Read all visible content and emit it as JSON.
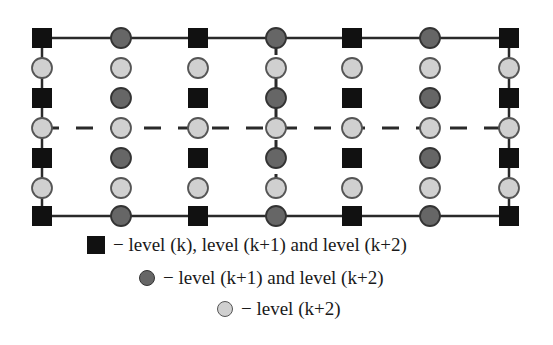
{
  "grid": {
    "columns_x": [
      42,
      121,
      198,
      276,
      352,
      430,
      509
    ],
    "rows_y": [
      38,
      68,
      98,
      128,
      158,
      188,
      216
    ],
    "node_types": {
      "square": "level (k), level (k+1) and level (k+2)",
      "dark_circle": "level (k+1) and level (k+2)",
      "light_circle": "level (k+2)"
    },
    "dashed_horizontal_row_index": 3,
    "dashed_vertical_column_index": 3,
    "colors": {
      "square_fill": "#111111",
      "dark_circle_fill": "#666666",
      "dark_circle_stroke": "#333333",
      "light_circle_fill": "#d0d0d0",
      "light_circle_stroke": "#555555",
      "line": "#2a2a2a"
    }
  },
  "legend": {
    "items": [
      {
        "symbol": "square",
        "label": "− level (k), level (k+1) and level (k+2)"
      },
      {
        "symbol": "dark-circle",
        "label": "− level (k+1) and level (k+2)"
      },
      {
        "symbol": "light-circle",
        "label": "− level (k+2)"
      }
    ]
  }
}
